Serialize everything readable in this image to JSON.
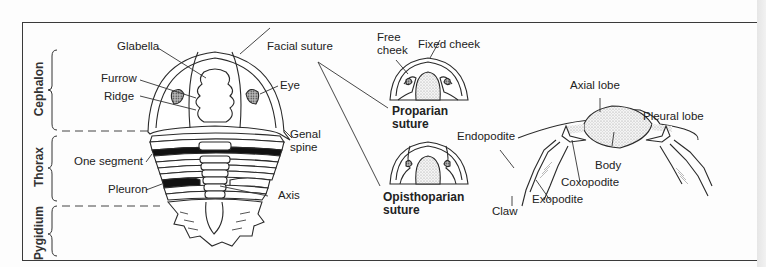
{
  "diagram": {
    "regions": {
      "cephalon": "Cephalon",
      "thorax": "Thorax",
      "pygidium": "Pygidium"
    },
    "dorsal_labels": {
      "glabella": "Glabella",
      "furrow": "Furrow",
      "ridge": "Ridge",
      "facial_suture": "Facial suture",
      "eye": "Eye",
      "genal_spine_1": "Genal",
      "genal_spine_2": "spine",
      "one_segment": "One segment",
      "pleuron": "Pleuron",
      "axis": "Axis"
    },
    "suture_types": {
      "free_cheek_1": "Free",
      "free_cheek_2": "cheek",
      "fixed_cheek": "Fixed cheek",
      "proparian_1": "Proparian",
      "proparian_2": "suture",
      "opisthoparian_1": "Opisthoparian",
      "opisthoparian_2": "suture"
    },
    "cross_section": {
      "axial_lobe": "Axial lobe",
      "pleural_lobe": "Pleural lobe",
      "endopodite": "Endopodite",
      "body": "Body",
      "coxopodite": "Coxopodite",
      "exopodite": "Exopodite",
      "claw": "Claw"
    },
    "colors": {
      "line": "#2a2a2a",
      "segment_fill": "#111111",
      "stipple": "#d8d8d8",
      "eye_fill": "#777777"
    }
  }
}
